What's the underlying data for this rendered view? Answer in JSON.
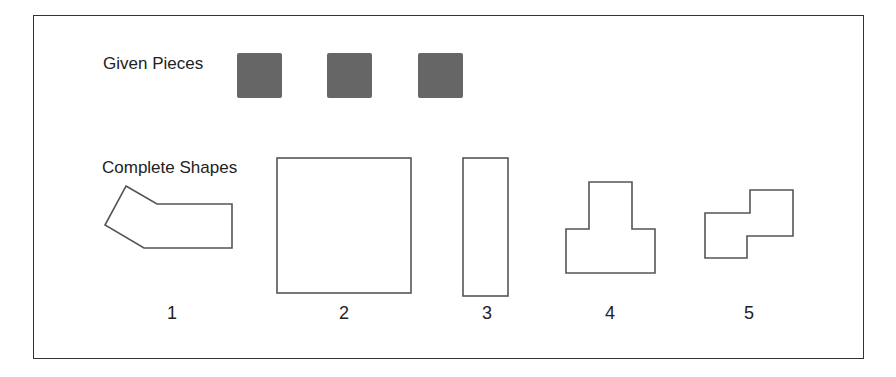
{
  "labels": {
    "given": "Given Pieces",
    "complete": "Complete Shapes"
  },
  "pieces": [
    {
      "name": "piece-1",
      "color": "#666666"
    },
    {
      "name": "piece-2",
      "color": "#666666"
    },
    {
      "name": "piece-3",
      "color": "#666666"
    }
  ],
  "shapes": [
    {
      "number": "1",
      "description": "bent pentagonal/hexagonal shape"
    },
    {
      "number": "2",
      "description": "large square"
    },
    {
      "number": "3",
      "description": "tall rectangle"
    },
    {
      "number": "4",
      "description": "T-shaped polygon"
    },
    {
      "number": "5",
      "description": "Z-shaped polygon"
    }
  ]
}
